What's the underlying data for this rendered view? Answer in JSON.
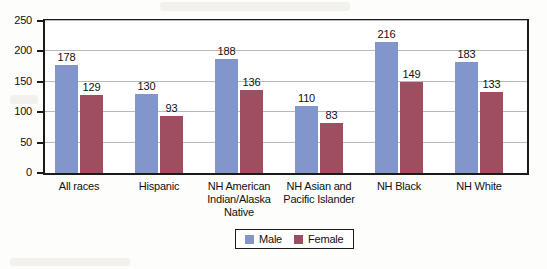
{
  "chart_data": {
    "type": "bar",
    "title": "",
    "xlabel": "",
    "ylabel": "",
    "ylim": [
      0,
      250
    ],
    "yticks": [
      0,
      50,
      100,
      150,
      200,
      250
    ],
    "grid": true,
    "legend_position": "bottom-center",
    "categories": [
      "All races",
      "Hispanic",
      "NH American\nIndian/Alaska\nNative",
      "NH Asian and\nPacific Islander",
      "NH Black",
      "NH White"
    ],
    "series": [
      {
        "name": "Male",
        "color": "#8296cb",
        "values": [
          178,
          130,
          188,
          110,
          216,
          183
        ]
      },
      {
        "name": "Female",
        "color": "#9e4e60",
        "values": [
          129,
          93,
          136,
          83,
          149,
          133
        ]
      }
    ]
  },
  "legend": {
    "entries": [
      {
        "label": "Male"
      },
      {
        "label": "Female"
      }
    ]
  },
  "colors": {
    "male": "#8296cb",
    "female": "#9e4e60",
    "axis": "#1a1a1a",
    "gridline": "#b9b9b9",
    "text": "#111111",
    "background": "#fdfdfb"
  }
}
